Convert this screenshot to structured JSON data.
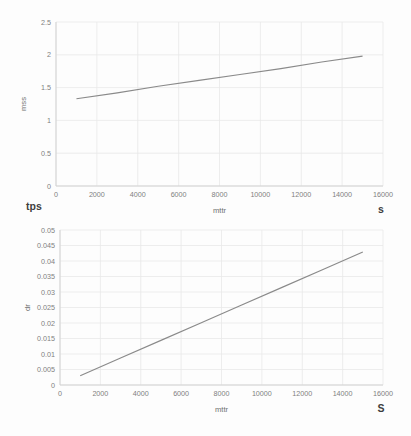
{
  "page": {
    "background": "#fdfdfd",
    "grid_color": "#e8e8e8",
    "axis_color": "#d0d0d0",
    "line_color": "#8a8a8a",
    "tick_color": "#7f7f7f"
  },
  "chart_data": [
    {
      "id": "top",
      "type": "line",
      "title": "",
      "xlabel": "mttr",
      "ylabel": "mss",
      "xlim": [
        0,
        16000
      ],
      "ylim": [
        0,
        2.5
      ],
      "xticks": [
        "0",
        "2000",
        "4000",
        "6000",
        "8000",
        "10000",
        "12000",
        "14000",
        "16000"
      ],
      "xtick_values": [
        0,
        2000,
        4000,
        6000,
        8000,
        10000,
        12000,
        14000,
        16000
      ],
      "yticks": [
        "0",
        "0.5",
        "1",
        "1.5",
        "2",
        "2.5"
      ],
      "ytick_values": [
        0,
        0.5,
        1,
        1.5,
        2,
        2.5
      ],
      "grid": true,
      "legend": "none",
      "x": [
        1000,
        3000,
        5000,
        7000,
        9000,
        11000,
        13000,
        15000
      ],
      "values": [
        1.33,
        1.42,
        1.52,
        1.61,
        1.7,
        1.79,
        1.89,
        1.98
      ],
      "series": [
        {
          "name": "mss",
          "values": [
            1.33,
            1.42,
            1.52,
            1.61,
            1.7,
            1.79,
            1.89,
            1.98
          ]
        }
      ],
      "annotations": {
        "corner_bottom_left": "tps",
        "corner_bottom_right": "s"
      }
    },
    {
      "id": "bottom",
      "type": "line",
      "title": "",
      "xlabel": "mttr",
      "ylabel": "dr",
      "xlim": [
        0,
        16000
      ],
      "ylim": [
        0,
        0.05
      ],
      "xticks": [
        "0",
        "2000",
        "4000",
        "6000",
        "8000",
        "10000",
        "12000",
        "14000",
        "16000"
      ],
      "xtick_values": [
        0,
        2000,
        4000,
        6000,
        8000,
        10000,
        12000,
        14000,
        16000
      ],
      "yticks": [
        "0",
        "0.005",
        "0.01",
        "0.015",
        "0.02",
        "0.025",
        "0.03",
        "0.035",
        "0.04",
        "0.045",
        "0.05"
      ],
      "ytick_values": [
        0,
        0.005,
        0.01,
        0.015,
        0.02,
        0.025,
        0.03,
        0.035,
        0.04,
        0.045,
        0.05
      ],
      "grid": true,
      "legend": "none",
      "x": [
        1000,
        3000,
        5000,
        7000,
        9000,
        11000,
        13000,
        15000
      ],
      "values": [
        0.003,
        0.0087,
        0.0144,
        0.0201,
        0.0258,
        0.0315,
        0.0372,
        0.0429
      ],
      "series": [
        {
          "name": "dr",
          "values": [
            0.003,
            0.0087,
            0.0144,
            0.0201,
            0.0258,
            0.0315,
            0.0372,
            0.0429
          ]
        }
      ],
      "annotations": {
        "corner_bottom_left": "",
        "corner_bottom_right": "S"
      }
    }
  ]
}
